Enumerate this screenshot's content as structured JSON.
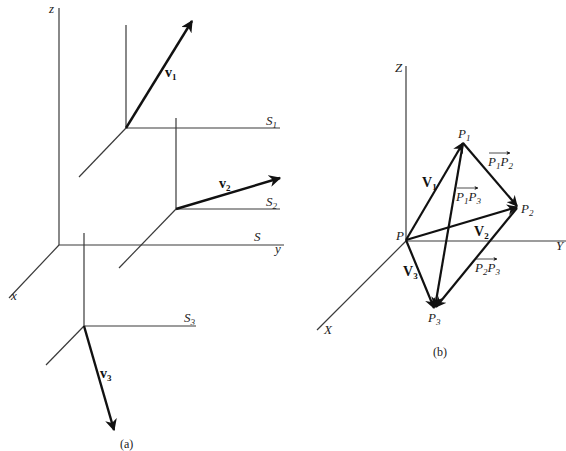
{
  "panel_a": {
    "caption": "(a)",
    "axis_labels": {
      "z": "z",
      "x": "x",
      "y": "y"
    },
    "frames": [
      {
        "name": "S",
        "label": "S",
        "sub": ""
      },
      {
        "name": "S1",
        "label": "S",
        "sub": "1"
      },
      {
        "name": "S2",
        "label": "S",
        "sub": "2"
      },
      {
        "name": "S3",
        "label": "S",
        "sub": "3"
      }
    ],
    "vectors": [
      {
        "name": "v1",
        "label": "v",
        "sub": "1"
      },
      {
        "name": "v2",
        "label": "v",
        "sub": "2"
      },
      {
        "name": "v3",
        "label": "v",
        "sub": "3"
      }
    ]
  },
  "panel_b": {
    "caption": "(b)",
    "axis_labels": {
      "z": "Z",
      "x": "X",
      "y": "Y"
    },
    "points": [
      {
        "name": "P",
        "label": "P",
        "sub": ""
      },
      {
        "name": "P1",
        "label": "P",
        "sub": "1"
      },
      {
        "name": "P2",
        "label": "P",
        "sub": "2"
      },
      {
        "name": "P3",
        "label": "P",
        "sub": "3"
      }
    ],
    "vectors": [
      {
        "name": "V1",
        "label": "V",
        "sub": "1"
      },
      {
        "name": "V2",
        "label": "V",
        "sub": "2"
      },
      {
        "name": "V3",
        "label": "V",
        "sub": "3"
      },
      {
        "name": "P1P2",
        "a": "P",
        "asub": "1",
        "b": "P",
        "bsub": "2"
      },
      {
        "name": "P1P3",
        "a": "P",
        "asub": "1",
        "b": "P",
        "bsub": "3"
      },
      {
        "name": "P2P3",
        "a": "P",
        "asub": "2",
        "b": "P",
        "bsub": "3"
      }
    ]
  }
}
